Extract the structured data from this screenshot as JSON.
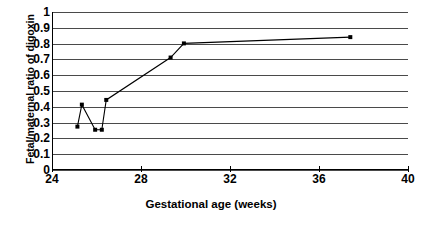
{
  "chart_data": {
    "type": "line",
    "title": "",
    "xlabel": "Gestational age (weeks)",
    "ylabel": "Fetal/maternal ratio of digoxin",
    "xlim": [
      24,
      40
    ],
    "ylim": [
      0,
      1
    ],
    "xticks": [
      24,
      28,
      32,
      36,
      40
    ],
    "xtick_labels": [
      "24",
      "28",
      "32",
      "36",
      "40"
    ],
    "yticks": [
      0,
      0.1,
      0.2,
      0.3,
      0.4,
      0.5,
      0.6,
      0.7,
      0.8,
      0.9,
      1
    ],
    "ytick_labels": [
      "0",
      "0.1",
      "0.2",
      "0.3",
      "0.4",
      "0.5",
      "0.6",
      "0.7",
      "0.8",
      "0.9",
      "1"
    ],
    "grid": "horizontal",
    "legend": "none",
    "marker": "filled-square",
    "line_color": "#000000",
    "grid_color": "#4a4a4a",
    "series": [
      {
        "name": "Fetal/maternal digoxin ratio",
        "x": [
          25.1,
          25.3,
          25.9,
          26.2,
          26.4,
          29.3,
          29.9,
          37.4
        ],
        "y": [
          0.27,
          0.41,
          0.25,
          0.25,
          0.44,
          0.71,
          0.8,
          0.84
        ]
      }
    ]
  }
}
